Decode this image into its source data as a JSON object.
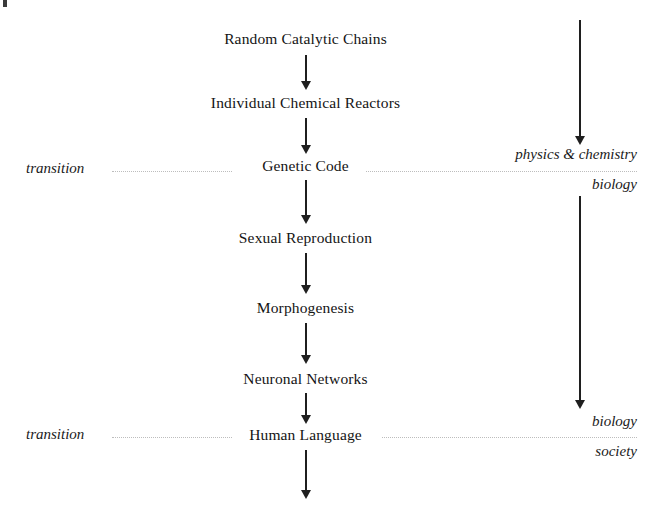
{
  "diagram": {
    "background_color": "#ffffff",
    "text_color": "#141414",
    "arrow_color": "#1f1f1f",
    "dotted_rule_color": "#bdbdbd",
    "chain": [
      {
        "label": "Random Catalytic Chains"
      },
      {
        "label": "Individual Chemical Reactors"
      },
      {
        "label": "Genetic Code"
      },
      {
        "label": "Sexual Reproduction"
      },
      {
        "label": "Morphogenesis"
      },
      {
        "label": "Neuronal Networks"
      },
      {
        "label": "Human Language"
      }
    ],
    "transitions": [
      {
        "name": "upper-transition",
        "left_label": "transition",
        "node_label": "Genetic Code",
        "above_label": "physics & chemistry",
        "below_label": "biology"
      },
      {
        "name": "lower-transition",
        "left_label": "transition",
        "node_label": "Human Language",
        "above_label": "biology",
        "below_label": "society"
      }
    ],
    "right_column": {
      "upper_arrow_name": "physics-to-biology-arrow",
      "lower_arrow_name": "biology-to-society-arrow",
      "upper_above_label": "physics & chemistry",
      "upper_below_label": "biology",
      "lower_above_label": "biology",
      "lower_below_label": "society"
    }
  }
}
